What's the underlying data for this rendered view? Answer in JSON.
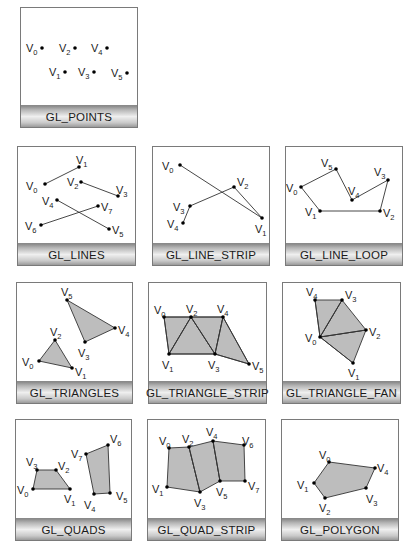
{
  "colors": {
    "panel_border": "#7a7a7a",
    "fill": "#bdbdbd",
    "edge": "#333333",
    "vertex": "#000000",
    "label_bar_light": "#efefef",
    "label_bar_dark": "#8a8a8a"
  },
  "panels": [
    {
      "id": "points",
      "label": "GL_POINTS",
      "box": {
        "x": 20,
        "y": 7,
        "w": 118,
        "h": 121
      },
      "vertices": [
        {
          "name": "V",
          "sub": "0",
          "x": 42,
          "y": 48,
          "lx": 26,
          "ly": 52
        },
        {
          "name": "V",
          "sub": "2",
          "x": 75,
          "y": 48,
          "lx": 59,
          "ly": 52
        },
        {
          "name": "V",
          "sub": "4",
          "x": 107,
          "y": 48,
          "lx": 91,
          "ly": 52
        },
        {
          "name": "V",
          "sub": "1",
          "x": 65,
          "y": 72,
          "lx": 49,
          "ly": 76
        },
        {
          "name": "V",
          "sub": "3",
          "x": 94,
          "y": 72,
          "lx": 78,
          "ly": 76
        },
        {
          "name": "V",
          "sub": "5",
          "x": 127,
          "y": 73,
          "lx": 111,
          "ly": 77
        }
      ],
      "edges": [],
      "polygons": []
    },
    {
      "id": "lines",
      "label": "GL_LINES",
      "box": {
        "x": 17,
        "y": 146,
        "w": 119,
        "h": 120
      },
      "vertices": [
        {
          "name": "V",
          "sub": "0",
          "x": 45,
          "y": 184,
          "lx": 26,
          "ly": 190
        },
        {
          "name": "V",
          "sub": "1",
          "x": 79,
          "y": 167,
          "lx": 76,
          "ly": 164
        },
        {
          "name": "V",
          "sub": "2",
          "x": 81,
          "y": 182,
          "lx": 67,
          "ly": 186
        },
        {
          "name": "V",
          "sub": "3",
          "x": 118,
          "y": 196,
          "lx": 116,
          "ly": 194
        },
        {
          "name": "V",
          "sub": "4",
          "x": 57,
          "y": 200,
          "lx": 42,
          "ly": 205
        },
        {
          "name": "V",
          "sub": "5",
          "x": 109,
          "y": 229,
          "lx": 112,
          "ly": 234
        },
        {
          "name": "V",
          "sub": "6",
          "x": 41,
          "y": 225,
          "lx": 25,
          "ly": 230
        },
        {
          "name": "V",
          "sub": "7",
          "x": 98,
          "y": 206,
          "lx": 101,
          "ly": 211
        }
      ],
      "edges": [
        [
          0,
          1
        ],
        [
          2,
          3
        ],
        [
          4,
          5
        ],
        [
          6,
          7
        ]
      ],
      "polygons": []
    },
    {
      "id": "line_strip",
      "label": "GL_LINE_STRIP",
      "box": {
        "x": 152,
        "y": 146,
        "w": 118,
        "h": 120
      },
      "vertices": [
        {
          "name": "V",
          "sub": "0",
          "x": 180,
          "y": 165,
          "lx": 162,
          "ly": 170
        },
        {
          "name": "V",
          "sub": "1",
          "x": 262,
          "y": 218,
          "lx": 255,
          "ly": 233
        },
        {
          "name": "V",
          "sub": "2",
          "x": 234,
          "y": 187,
          "lx": 237,
          "ly": 186
        },
        {
          "name": "V",
          "sub": "3",
          "x": 190,
          "y": 206,
          "lx": 173,
          "ly": 211
        },
        {
          "name": "V",
          "sub": "4",
          "x": 183,
          "y": 223,
          "lx": 167,
          "ly": 228
        }
      ],
      "edges": [
        [
          0,
          1
        ],
        [
          1,
          2
        ],
        [
          2,
          3
        ],
        [
          3,
          4
        ]
      ],
      "polygons": []
    },
    {
      "id": "line_loop",
      "label": "GL_LINE_LOOP",
      "box": {
        "x": 285,
        "y": 146,
        "w": 118,
        "h": 120
      },
      "vertices": [
        {
          "name": "V",
          "sub": "0",
          "x": 301,
          "y": 187,
          "lx": 286,
          "ly": 192
        },
        {
          "name": "V",
          "sub": "1",
          "x": 320,
          "y": 211,
          "lx": 305,
          "ly": 216
        },
        {
          "name": "V",
          "sub": "2",
          "x": 380,
          "y": 211,
          "lx": 383,
          "ly": 217
        },
        {
          "name": "V",
          "sub": "3",
          "x": 388,
          "y": 180,
          "lx": 374,
          "ly": 176
        },
        {
          "name": "V",
          "sub": "4",
          "x": 352,
          "y": 200,
          "lx": 348,
          "ly": 195
        },
        {
          "name": "V",
          "sub": "5",
          "x": 336,
          "y": 169,
          "lx": 321,
          "ly": 167
        }
      ],
      "edges": [
        [
          0,
          1
        ],
        [
          1,
          2
        ],
        [
          2,
          3
        ],
        [
          3,
          4
        ],
        [
          4,
          5
        ],
        [
          5,
          0
        ]
      ],
      "polygons": []
    },
    {
      "id": "triangles",
      "label": "GL_TRIANGLES",
      "box": {
        "x": 16,
        "y": 282,
        "w": 117,
        "h": 122
      },
      "vertices": [
        {
          "name": "V",
          "sub": "0",
          "x": 39,
          "y": 361,
          "lx": 22,
          "ly": 366
        },
        {
          "name": "V",
          "sub": "1",
          "x": 72,
          "y": 368,
          "lx": 75,
          "ly": 376
        },
        {
          "name": "V",
          "sub": "2",
          "x": 55,
          "y": 340,
          "lx": 50,
          "ly": 336
        },
        {
          "name": "V",
          "sub": "3",
          "x": 85,
          "y": 342,
          "lx": 78,
          "ly": 357
        },
        {
          "name": "V",
          "sub": "4",
          "x": 115,
          "y": 328,
          "lx": 118,
          "ly": 334
        },
        {
          "name": "V",
          "sub": "5",
          "x": 67,
          "y": 300,
          "lx": 61,
          "ly": 296
        }
      ],
      "edges": [],
      "polygons": [
        [
          0,
          1,
          2
        ],
        [
          3,
          4,
          5
        ]
      ]
    },
    {
      "id": "triangle_strip",
      "label": "GL_TRIANGLE_STRIP",
      "box": {
        "x": 148,
        "y": 282,
        "w": 119,
        "h": 122
      },
      "vertices": [
        {
          "name": "V",
          "sub": "0",
          "x": 164,
          "y": 317,
          "lx": 154,
          "ly": 314
        },
        {
          "name": "V",
          "sub": "1",
          "x": 169,
          "y": 354,
          "lx": 162,
          "ly": 369
        },
        {
          "name": "V",
          "sub": "2",
          "x": 191,
          "y": 317,
          "lx": 186,
          "ly": 313
        },
        {
          "name": "V",
          "sub": "3",
          "x": 215,
          "y": 354,
          "lx": 208,
          "ly": 369
        },
        {
          "name": "V",
          "sub": "4",
          "x": 223,
          "y": 317,
          "lx": 217,
          "ly": 313
        },
        {
          "name": "V",
          "sub": "5",
          "x": 249,
          "y": 364,
          "lx": 252,
          "ly": 370
        }
      ],
      "edges": [
        [
          0,
          2
        ],
        [
          2,
          4
        ],
        [
          1,
          3
        ],
        [
          0,
          1
        ],
        [
          1,
          2
        ],
        [
          2,
          3
        ],
        [
          3,
          4
        ],
        [
          4,
          5
        ],
        [
          3,
          5
        ]
      ],
      "polygons": [
        [
          0,
          1,
          2
        ],
        [
          1,
          2,
          3
        ],
        [
          2,
          3,
          4
        ],
        [
          3,
          4,
          5
        ]
      ]
    },
    {
      "id": "triangle_fan",
      "label": "GL_TRIANGLE_FAN",
      "box": {
        "x": 282,
        "y": 282,
        "w": 119,
        "h": 122
      },
      "vertices": [
        {
          "name": "V",
          "sub": "0",
          "x": 320,
          "y": 337,
          "lx": 305,
          "ly": 342
        },
        {
          "name": "V",
          "sub": "1",
          "x": 353,
          "y": 363,
          "lx": 348,
          "ly": 377
        },
        {
          "name": "V",
          "sub": "2",
          "x": 366,
          "y": 330,
          "lx": 369,
          "ly": 336
        },
        {
          "name": "V",
          "sub": "3",
          "x": 342,
          "y": 300,
          "lx": 345,
          "ly": 299
        },
        {
          "name": "V",
          "sub": "4",
          "x": 315,
          "y": 300,
          "lx": 306,
          "ly": 296
        }
      ],
      "edges": [
        [
          0,
          1
        ],
        [
          0,
          2
        ],
        [
          0,
          3
        ],
        [
          0,
          4
        ]
      ],
      "polygons": [
        [
          0,
          1,
          2
        ],
        [
          0,
          2,
          3
        ],
        [
          0,
          3,
          4
        ]
      ]
    },
    {
      "id": "quads",
      "label": "GL_QUADS",
      "box": {
        "x": 15,
        "y": 419,
        "w": 117,
        "h": 122
      },
      "vertices": [
        {
          "name": "V",
          "sub": "0",
          "x": 33,
          "y": 489,
          "lx": 17,
          "ly": 494
        },
        {
          "name": "V",
          "sub": "1",
          "x": 70,
          "y": 489,
          "lx": 64,
          "ly": 503
        },
        {
          "name": "V",
          "sub": "2",
          "x": 56,
          "y": 470,
          "lx": 58,
          "ly": 470
        },
        {
          "name": "V",
          "sub": "3",
          "x": 37,
          "y": 470,
          "lx": 26,
          "ly": 466
        },
        {
          "name": "V",
          "sub": "4",
          "x": 94,
          "y": 494,
          "lx": 84,
          "ly": 509
        },
        {
          "name": "V",
          "sub": "5",
          "x": 110,
          "y": 493,
          "lx": 116,
          "ly": 500
        },
        {
          "name": "V",
          "sub": "6",
          "x": 108,
          "y": 445,
          "lx": 110,
          "ly": 443
        },
        {
          "name": "V",
          "sub": "7",
          "x": 86,
          "y": 454,
          "lx": 71,
          "ly": 458
        }
      ],
      "edges": [],
      "polygons": [
        [
          0,
          1,
          2,
          3
        ],
        [
          4,
          5,
          6,
          7
        ]
      ]
    },
    {
      "id": "quad_strip",
      "label": "GL_QUAD_STRIP",
      "box": {
        "x": 147,
        "y": 419,
        "w": 119,
        "h": 122
      },
      "vertices": [
        {
          "name": "V",
          "sub": "0",
          "x": 169,
          "y": 448,
          "lx": 159,
          "ly": 445
        },
        {
          "name": "V",
          "sub": "1",
          "x": 167,
          "y": 487,
          "lx": 152,
          "ly": 493
        },
        {
          "name": "V",
          "sub": "2",
          "x": 189,
          "y": 447,
          "lx": 182,
          "ly": 443
        },
        {
          "name": "V",
          "sub": "3",
          "x": 200,
          "y": 492,
          "lx": 194,
          "ly": 507
        },
        {
          "name": "V",
          "sub": "4",
          "x": 213,
          "y": 441,
          "lx": 206,
          "ly": 436
        },
        {
          "name": "V",
          "sub": "5",
          "x": 220,
          "y": 481,
          "lx": 216,
          "ly": 496
        },
        {
          "name": "V",
          "sub": "6",
          "x": 244,
          "y": 445,
          "lx": 242,
          "ly": 445
        },
        {
          "name": "V",
          "sub": "7",
          "x": 245,
          "y": 481,
          "lx": 248,
          "ly": 490
        }
      ],
      "edges": [
        [
          2,
          3
        ],
        [
          4,
          5
        ]
      ],
      "polygons": [
        [
          0,
          1,
          3,
          2
        ],
        [
          2,
          3,
          5,
          4
        ],
        [
          4,
          5,
          7,
          6
        ]
      ]
    },
    {
      "id": "polygon",
      "label": "GL_POLYGON",
      "box": {
        "x": 281,
        "y": 419,
        "w": 118,
        "h": 122
      },
      "vertices": [
        {
          "name": "V",
          "sub": "0",
          "x": 329,
          "y": 462,
          "lx": 319,
          "ly": 459
        },
        {
          "name": "V",
          "sub": "1",
          "x": 314,
          "y": 483,
          "lx": 297,
          "ly": 489
        },
        {
          "name": "V",
          "sub": "2",
          "x": 325,
          "y": 498,
          "lx": 319,
          "ly": 512
        },
        {
          "name": "V",
          "sub": "3",
          "x": 366,
          "y": 488,
          "lx": 366,
          "ly": 503
        },
        {
          "name": "V",
          "sub": "4",
          "x": 375,
          "y": 468,
          "lx": 377,
          "ly": 472
        }
      ],
      "edges": [],
      "polygons": [
        [
          0,
          1,
          2,
          3,
          4
        ]
      ]
    }
  ]
}
